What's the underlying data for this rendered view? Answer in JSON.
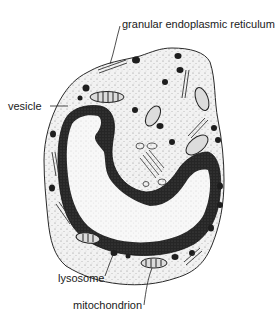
{
  "figure": {
    "labels": {
      "granular_er": "granular endoplasmic reticulum",
      "vesicle": "vesicle",
      "lysosome": "lysosome",
      "mitochondrion": "mitochondrion"
    },
    "colors": {
      "outline": "#2a2a2a",
      "cytoplasm": "#f3f3f3",
      "chromatin": "#1e1e1e",
      "nucleoplasm": "#f7f7f7",
      "text": "#1a1a1a"
    }
  }
}
